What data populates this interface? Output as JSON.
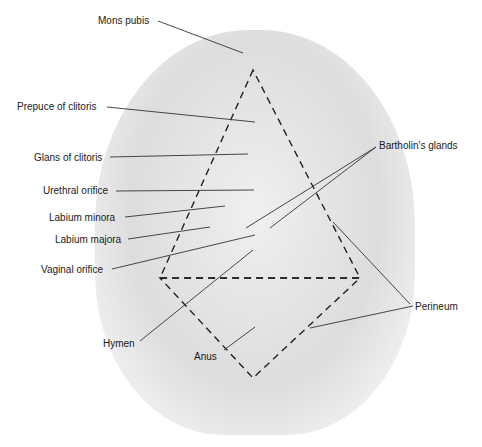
{
  "figure": {
    "type": "labeled anatomical diagram",
    "illustration_note": "Grayscale medical illustration; rendered here as a neutral abstract backdrop",
    "regions": [
      {
        "name": "urogenital triangle (upper dashed triangle)",
        "points": [
          [
            253,
            70
          ],
          [
            160,
            278
          ],
          [
            360,
            278
          ]
        ]
      },
      {
        "name": "anal triangle (lower dashed triangle)",
        "points": [
          [
            160,
            278
          ],
          [
            360,
            278
          ],
          [
            253,
            378
          ]
        ]
      }
    ]
  },
  "labels": [
    {
      "id": "mons-pubis",
      "text": "Mons pubis",
      "x": 98,
      "y": 15,
      "line": [
        [
          158,
          21
        ],
        [
          243,
          53
        ]
      ]
    },
    {
      "id": "prepuce-of-clitoris",
      "text": "Prepuce of clitoris",
      "x": 17,
      "y": 101,
      "line": [
        [
          107,
          107
        ],
        [
          255,
          122
        ]
      ]
    },
    {
      "id": "glans-of-clitoris",
      "text": "Glans of clitoris",
      "x": 34,
      "y": 152,
      "line": [
        [
          110,
          157
        ],
        [
          248,
          154
        ]
      ]
    },
    {
      "id": "bartholins-glands",
      "text": "Bartholin's glands",
      "x": 379,
      "y": 140,
      "lines": [
        [
          [
            376,
            147
          ],
          [
            246,
            228
          ]
        ],
        [
          [
            376,
            147
          ],
          [
            270,
            228
          ]
        ]
      ]
    },
    {
      "id": "urethral-orifice",
      "text": "Urethral orifice",
      "x": 43,
      "y": 185,
      "line": [
        [
          116,
          191
        ],
        [
          254,
          190
        ]
      ]
    },
    {
      "id": "labium-minora",
      "text": "Labium minora",
      "x": 49,
      "y": 212,
      "line": [
        [
          125,
          217
        ],
        [
          225,
          206
        ]
      ]
    },
    {
      "id": "labium-majora",
      "text": "Labium majora",
      "x": 55,
      "y": 234,
      "line": [
        [
          128,
          239
        ],
        [
          210,
          227
        ]
      ]
    },
    {
      "id": "vaginal-orifice",
      "text": "Vaginal orifice",
      "x": 41,
      "y": 264,
      "line": [
        [
          112,
          269
        ],
        [
          255,
          235
        ]
      ]
    },
    {
      "id": "perineum",
      "text": "Perineum",
      "x": 415,
      "y": 301,
      "lines": [
        [
          [
            410,
            304
          ],
          [
            333,
            222
          ]
        ],
        [
          [
            413,
            306
          ],
          [
            310,
            328
          ]
        ]
      ]
    },
    {
      "id": "hymen",
      "text": "Hymen",
      "x": 103,
      "y": 338,
      "line": [
        [
          140,
          341
        ],
        [
          253,
          250
        ]
      ]
    },
    {
      "id": "anus",
      "text": "Anus",
      "x": 194,
      "y": 351,
      "line": [
        [
          224,
          350
        ],
        [
          255,
          327
        ]
      ]
    }
  ]
}
